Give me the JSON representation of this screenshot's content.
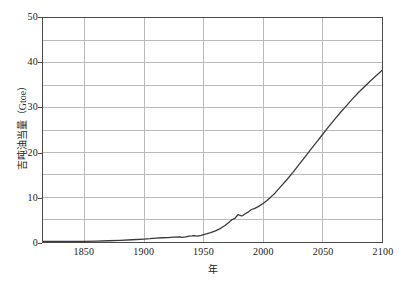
{
  "chart_data": {
    "type": "line",
    "title": "",
    "xlabel": "年",
    "ylabel": "吉吨油当量（Gtoe）",
    "xlim": [
      1815,
      2100
    ],
    "ylim": [
      0,
      50
    ],
    "grid": true,
    "legend": null,
    "line_color": "#3a3a3a",
    "frame_color": "#4a4a4a",
    "grid_color": "#b9b9b9",
    "xticks": [
      1850,
      1900,
      1950,
      2000,
      2050,
      2100
    ],
    "xtick_labels": [
      "1850",
      "1900",
      "1950",
      "2000",
      "2050",
      "2100"
    ],
    "yticks": [
      0,
      10,
      20,
      30,
      40,
      50
    ],
    "ytick_labels": [
      "0",
      "10",
      "20",
      "30",
      "40",
      "50"
    ],
    "y_minor_ticks": [
      5,
      15,
      25,
      35,
      45
    ],
    "series": [
      {
        "name": "世界一次能源消费量",
        "x": [
          1815,
          1830,
          1850,
          1860,
          1870,
          1880,
          1890,
          1900,
          1905,
          1910,
          1915,
          1920,
          1925,
          1930,
          1932,
          1935,
          1938,
          1940,
          1942,
          1945,
          1948,
          1950,
          1953,
          1956,
          1960,
          1964,
          1968,
          1971,
          1974,
          1976,
          1979,
          1980,
          1982,
          1983,
          1985,
          1987,
          1990,
          1993,
          1996,
          2000,
          2003,
          2006,
          2010,
          2015,
          2020,
          2025,
          2030,
          2035,
          2040,
          2045,
          2050,
          2055,
          2060,
          2065,
          2070,
          2075,
          2080,
          2085,
          2090,
          2095,
          2100
        ],
        "y": [
          0.12,
          0.13,
          0.15,
          0.2,
          0.28,
          0.38,
          0.5,
          0.65,
          0.75,
          0.88,
          0.95,
          0.98,
          1.1,
          1.15,
          1.02,
          1.12,
          1.3,
          1.35,
          1.42,
          1.3,
          1.5,
          1.65,
          1.85,
          2.1,
          2.5,
          3.0,
          3.7,
          4.3,
          5.0,
          5.2,
          6.1,
          6.0,
          5.85,
          5.9,
          6.3,
          6.6,
          7.2,
          7.5,
          7.9,
          8.6,
          9.2,
          9.9,
          10.9,
          12.4,
          13.9,
          15.5,
          17.2,
          18.9,
          20.6,
          22.3,
          24.0,
          25.7,
          27.3,
          28.9,
          30.4,
          31.9,
          33.3,
          34.6,
          35.9,
          37.1,
          38.3
        ]
      }
    ]
  }
}
